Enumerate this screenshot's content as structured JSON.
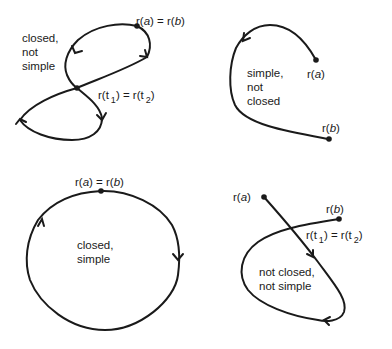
{
  "figure": {
    "panels": [
      {
        "id": "top-left",
        "description_lines": [
          "closed,",
          "not",
          "simple"
        ],
        "endpoint_label": {
          "r": "r(",
          "var": "a",
          "mid": ") = r(",
          "var2": "b",
          "end": ")"
        },
        "crossing_label": {
          "left": "r(t",
          "sub1": "1",
          "mid": ") = r(t",
          "sub2": "2",
          "end": ")"
        }
      },
      {
        "id": "top-right",
        "description_lines": [
          "simple,",
          "not",
          "closed"
        ],
        "start_label": {
          "pre": "r(",
          "var": "a",
          "end": ")"
        },
        "end_label": {
          "pre": "r(",
          "var": "b",
          "end": ")"
        }
      },
      {
        "id": "bottom-left",
        "description_lines": [
          "closed,",
          "simple"
        ],
        "endpoint_label": {
          "r": "r(",
          "var": "a",
          "mid": ") = r(",
          "var2": "b",
          "end": ")"
        }
      },
      {
        "id": "bottom-right",
        "description_lines": [
          "not closed,",
          "not simple"
        ],
        "start_label": {
          "pre": "r(",
          "var": "a",
          "end": ")"
        },
        "end_label": {
          "pre": "r(",
          "var": "b",
          "end": ")"
        },
        "crossing_label": {
          "left": "r(t",
          "sub1": "1",
          "mid": ") = r(t",
          "sub2": "2",
          "end": ")"
        }
      }
    ],
    "colors": {
      "stroke": "#1a1a1a",
      "background": "#ffffff"
    }
  }
}
